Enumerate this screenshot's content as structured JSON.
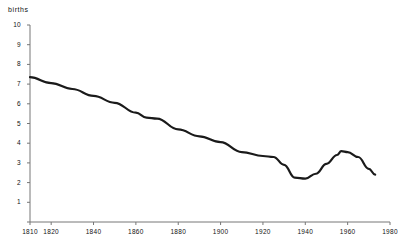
{
  "chart_data": {
    "type": "line",
    "title": "",
    "ylabel": "births",
    "xlabel": "",
    "xlim": [
      1810,
      1980
    ],
    "ylim": [
      0,
      10
    ],
    "grid": false,
    "legend": null,
    "xticks": [
      "1810",
      "1820",
      "1840",
      "1860",
      "1880",
      "1900",
      "1920",
      "1940",
      "1960",
      "1980"
    ],
    "xtick_values": [
      1810,
      1820,
      1840,
      1860,
      1880,
      1900,
      1920,
      1940,
      1960,
      1980
    ],
    "yticks": [
      "0",
      "1",
      "2",
      "3",
      "4",
      "5",
      "6",
      "7",
      "8",
      "9",
      "10"
    ],
    "ytick_values": [
      0,
      1,
      2,
      3,
      4,
      5,
      6,
      7,
      8,
      9,
      10
    ],
    "series": [
      {
        "name": "births",
        "color": "#1a1a1a",
        "x": [
          1810,
          1820,
          1830,
          1840,
          1850,
          1860,
          1865,
          1870,
          1880,
          1890,
          1900,
          1910,
          1920,
          1925,
          1930,
          1935,
          1940,
          1945,
          1950,
          1955,
          1957,
          1960,
          1965,
          1970,
          1973
        ],
        "y": [
          7.35,
          7.05,
          6.75,
          6.4,
          6.05,
          5.55,
          5.3,
          5.25,
          4.7,
          4.35,
          4.05,
          3.55,
          3.35,
          3.3,
          2.9,
          2.25,
          2.2,
          2.45,
          2.95,
          3.4,
          3.6,
          3.55,
          3.3,
          2.7,
          2.4
        ]
      }
    ]
  }
}
